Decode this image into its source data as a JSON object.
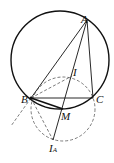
{
  "diagram": {
    "points": {
      "A": {
        "label": "A",
        "x": 87,
        "y": 20
      },
      "B": {
        "label": "B",
        "x": 31,
        "y": 98
      },
      "C": {
        "label": "C",
        "x": 93,
        "y": 98
      },
      "I": {
        "label": "I",
        "x": 72,
        "y": 76
      },
      "M": {
        "label": "M",
        "x": 63,
        "y": 109
      },
      "IA": {
        "label": "I",
        "sub": "A",
        "x": 53,
        "y": 140
      }
    },
    "circumcircle": {
      "cx": 60,
      "cy": 60,
      "r": 49,
      "style": "solid"
    },
    "dashed_circle": {
      "center": "M",
      "cx": 63,
      "cy": 109,
      "r": 32,
      "style": "dashed"
    },
    "colors": {
      "stroke": "#111111",
      "background": "#ffffff"
    }
  }
}
